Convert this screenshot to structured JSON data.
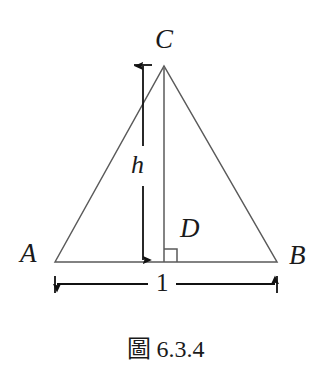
{
  "figure": {
    "caption_prefix": "圖",
    "caption_number": "6.3.4",
    "background_color": "#ffffff",
    "stroke_color": "#5a5a5a",
    "dimension_color": "#111111",
    "text_color": "#1a1a1a"
  },
  "diagram": {
    "type": "geometry-triangle",
    "labels": {
      "apex": "C",
      "left_vertex": "A",
      "right_vertex": "B",
      "foot": "D",
      "height": "h",
      "base_length": "1"
    },
    "points": {
      "A": {
        "x": 55,
        "y": 262
      },
      "B": {
        "x": 277,
        "y": 262
      },
      "C": {
        "x": 164,
        "y": 66
      },
      "D": {
        "x": 164,
        "y": 262
      }
    },
    "measurements": {
      "base_label": "1",
      "base_from_x": 55,
      "base_to_x": 277,
      "base_dim_y": 284,
      "height_label": "h",
      "height_x": 143,
      "height_from_y": 65,
      "height_to_y": 262
    },
    "right_angle_marker": {
      "present": true,
      "at": "D",
      "size": 13
    }
  }
}
